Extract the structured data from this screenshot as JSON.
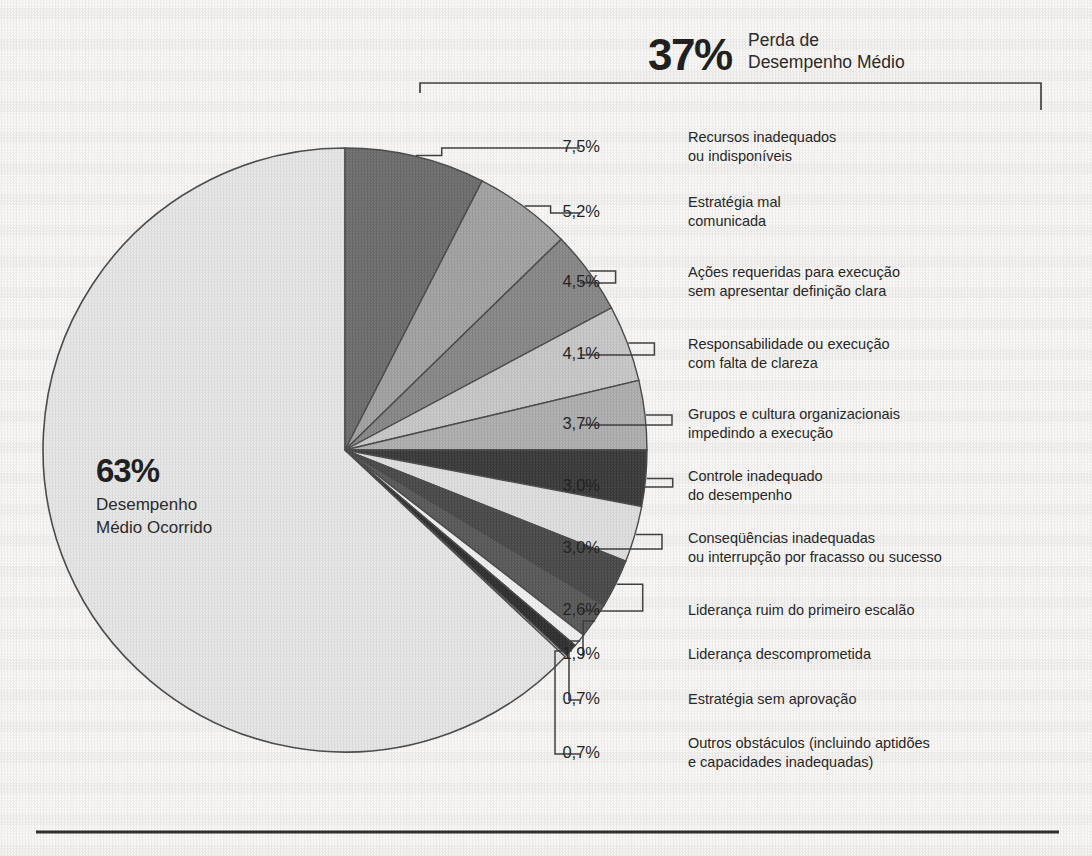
{
  "header": {
    "percent": "37%",
    "label_line1": "Perda de",
    "label_line2": "Desempenho Médio"
  },
  "center": {
    "percent": "63%",
    "label_line1": "Desempenho",
    "label_line2": "Médio Ocorrido"
  },
  "legend": [
    {
      "percent": "7,5%",
      "label": "Recursos inadequados\nou indisponíveis"
    },
    {
      "percent": "5,2%",
      "label": "Estratégia mal\ncomunicada"
    },
    {
      "percent": "4,5%",
      "label": "Ações requeridas para execução\nsem apresentar definição clara"
    },
    {
      "percent": "4,1%",
      "label": "Responsabilidade ou execução\ncom falta de clareza"
    },
    {
      "percent": "3,7%",
      "label": "Grupos e cultura organizacionais\nimpedindo a execução"
    },
    {
      "percent": "3,0%",
      "label": "Controle inadequado\ndo desempenho"
    },
    {
      "percent": "3,0%",
      "label": "Conseqüências inadequadas\nou interrupção por fracasso ou sucesso"
    },
    {
      "percent": "2,6%",
      "label": "Liderança ruim do primeiro escalão"
    },
    {
      "percent": "1,9%",
      "label": "Liderança descomprometida"
    },
    {
      "percent": "0,7%",
      "label": "Estratégia sem aprovação"
    },
    {
      "percent": "0,7%",
      "label": "Outros obstáculos (incluindo aptidões\ne capacidades inadequadas)"
    }
  ],
  "colors": {
    "slice_major": "#e8e8e8",
    "slice_1": "#6e6e6e",
    "slice_2": "#a3a3a3",
    "slice_3": "#888888",
    "slice_4": "#c9c9c9",
    "slice_5": "#b0b0b0",
    "slice_6": "#3a3a3a",
    "slice_7": "#e0e0e0",
    "slice_8": "#4a4a4a",
    "slice_9": "#5a5a5a",
    "slice_10": "#f2f2f2",
    "slice_11": "#303030",
    "outline": "#4a4a4a",
    "leader": "#3c3c3c",
    "rule": "#2a2a2a"
  },
  "chart_data": {
    "type": "pie",
    "units": "percent",
    "categories": [
      "Desempenho Médio Ocorrido",
      "Recursos inadequados ou indisponíveis",
      "Estratégia mal comunicada",
      "Ações requeridas para execução sem apresentar definição clara",
      "Responsabilidade ou execução com falta de clareza",
      "Grupos e cultura organizacionais impedindo a execução",
      "Controle inadequado do desempenho",
      "Conseqüências inadequadas ou interrupção por fracasso ou sucesso",
      "Liderança ruim do primeiro escalão",
      "Liderança descomprometida",
      "Estratégia sem aprovação",
      "Outros obstáculos (incluindo aptidões e capacidades inadequadas)"
    ],
    "values": [
      63,
      7.5,
      5.2,
      4.5,
      4.1,
      3.7,
      3.0,
      3.0,
      2.6,
      1.9,
      0.7,
      0.7
    ],
    "groups": [
      {
        "name": "Desempenho Médio Ocorrido",
        "value": 63
      },
      {
        "name": "Perda de Desempenho Médio",
        "value": 37
      }
    ],
    "legend_position": "right",
    "grid": false
  }
}
